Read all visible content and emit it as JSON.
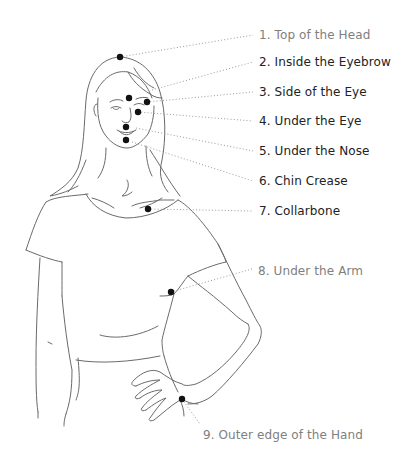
{
  "diagram": {
    "colors": {
      "outline": "#6a6a6a",
      "leader_line": "#9a9a9a",
      "dot": "#111111",
      "label_dark": "#222222",
      "label_gray": "#808080",
      "background": "#ffffff"
    },
    "points": [
      {
        "number": 1,
        "label": "1. Top of the Head",
        "dot": [
          120,
          57
        ],
        "label_pos": [
          259,
          28
        ],
        "tone": "gray"
      },
      {
        "number": 2,
        "label": "2. Inside the Eyebrow",
        "dot": [
          129,
          98
        ],
        "label_pos": [
          259,
          55
        ],
        "tone": "dark"
      },
      {
        "number": 3,
        "label": "3. Side of the Eye",
        "dot": [
          147,
          102
        ],
        "label_pos": [
          259,
          85
        ],
        "tone": "dark"
      },
      {
        "number": 4,
        "label": "4. Under the Eye",
        "dot": [
          138,
          112
        ],
        "label_pos": [
          259,
          114
        ],
        "tone": "dark"
      },
      {
        "number": 5,
        "label": "5. Under the Nose",
        "dot": [
          126,
          127
        ],
        "label_pos": [
          259,
          144
        ],
        "tone": "dark"
      },
      {
        "number": 6,
        "label": "6. Chin Crease",
        "dot": [
          126,
          140
        ],
        "label_pos": [
          259,
          174
        ],
        "tone": "dark"
      },
      {
        "number": 7,
        "label": "7. Collarbone",
        "dot": [
          148,
          209
        ],
        "label_pos": [
          259,
          204
        ],
        "tone": "dark"
      },
      {
        "number": 8,
        "label": "8. Under the Arm",
        "dot": [
          171,
          292
        ],
        "label_pos": [
          258,
          264
        ],
        "tone": "gray"
      },
      {
        "number": 9,
        "label": "9. Outer edge of the Hand",
        "dot": [
          182,
          399
        ],
        "label_pos": [
          203,
          428
        ],
        "tone": "gray"
      }
    ]
  }
}
